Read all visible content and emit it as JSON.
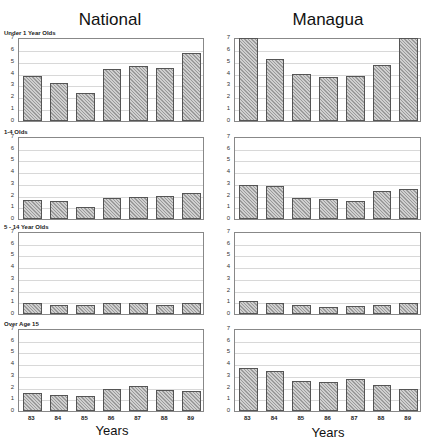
{
  "columns": [
    {
      "title": "National"
    },
    {
      "title": "Managua"
    }
  ],
  "row_labels": [
    "Under 1 Year Olds",
    "1-4 Olds",
    "5 - 14 Year Olds",
    "Over Age 15"
  ],
  "x_axis": {
    "label": "Years",
    "ticks": [
      "83",
      "84",
      "85",
      "86",
      "87",
      "88",
      "89"
    ]
  },
  "y_axis": {
    "min": 0,
    "max": 7,
    "ticks": [
      "0",
      "1",
      "2",
      "3",
      "4",
      "5",
      "6",
      "7"
    ]
  },
  "chart_data": [
    {
      "type": "bar",
      "title": "National - Under 1 Year Olds",
      "categories": [
        "83",
        "84",
        "85",
        "86",
        "87",
        "88",
        "89"
      ],
      "values": [
        3.8,
        3.2,
        2.4,
        4.4,
        4.6,
        4.5,
        5.7
      ],
      "xlabel": "Years",
      "ylabel": "",
      "ylim": [
        0,
        7
      ],
      "grid": true
    },
    {
      "type": "bar",
      "title": "Managua - Under 1 Year Olds",
      "categories": [
        "83",
        "84",
        "85",
        "86",
        "87",
        "88",
        "89"
      ],
      "values": [
        7.0,
        5.2,
        4.0,
        3.7,
        3.8,
        4.7,
        7.0
      ],
      "xlabel": "Years",
      "ylabel": "",
      "ylim": [
        0,
        7
      ],
      "grid": true
    },
    {
      "type": "bar",
      "title": "National - 1-4 Olds",
      "categories": [
        "83",
        "84",
        "85",
        "86",
        "87",
        "88",
        "89"
      ],
      "values": [
        1.6,
        1.5,
        1.0,
        1.8,
        1.9,
        2.0,
        2.2
      ],
      "xlabel": "Years",
      "ylabel": "",
      "ylim": [
        0,
        7
      ],
      "grid": true
    },
    {
      "type": "bar",
      "title": "Managua - 1-4 Olds",
      "categories": [
        "83",
        "84",
        "85",
        "86",
        "87",
        "88",
        "89"
      ],
      "values": [
        2.9,
        2.8,
        1.8,
        1.7,
        1.5,
        2.4,
        2.6
      ],
      "xlabel": "Years",
      "ylabel": "",
      "ylim": [
        0,
        7
      ],
      "grid": true
    },
    {
      "type": "bar",
      "title": "National - 5 - 14 Year Olds",
      "categories": [
        "83",
        "84",
        "85",
        "86",
        "87",
        "88",
        "89"
      ],
      "values": [
        0.9,
        0.8,
        0.8,
        0.9,
        0.9,
        0.8,
        0.9
      ],
      "xlabel": "Years",
      "ylabel": "",
      "ylim": [
        0,
        7
      ],
      "grid": true
    },
    {
      "type": "bar",
      "title": "Managua - 5 - 14 Year Olds",
      "categories": [
        "83",
        "84",
        "85",
        "86",
        "87",
        "88",
        "89"
      ],
      "values": [
        1.1,
        0.9,
        0.8,
        0.6,
        0.7,
        0.8,
        0.9
      ],
      "xlabel": "Years",
      "ylabel": "",
      "ylim": [
        0,
        7
      ],
      "grid": true
    },
    {
      "type": "bar",
      "title": "National - Over Age 15",
      "categories": [
        "83",
        "84",
        "85",
        "86",
        "87",
        "88",
        "89"
      ],
      "values": [
        1.5,
        1.4,
        1.3,
        1.9,
        2.1,
        1.8,
        1.7
      ],
      "xlabel": "Years",
      "ylabel": "",
      "ylim": [
        0,
        7
      ],
      "grid": true
    },
    {
      "type": "bar",
      "title": "Managua - Over Age 15",
      "categories": [
        "83",
        "84",
        "85",
        "86",
        "87",
        "88",
        "89"
      ],
      "values": [
        3.7,
        3.4,
        2.6,
        2.5,
        2.7,
        2.2,
        1.9
      ],
      "xlabel": "Years",
      "ylabel": "",
      "ylim": [
        0,
        7
      ],
      "grid": true
    }
  ]
}
